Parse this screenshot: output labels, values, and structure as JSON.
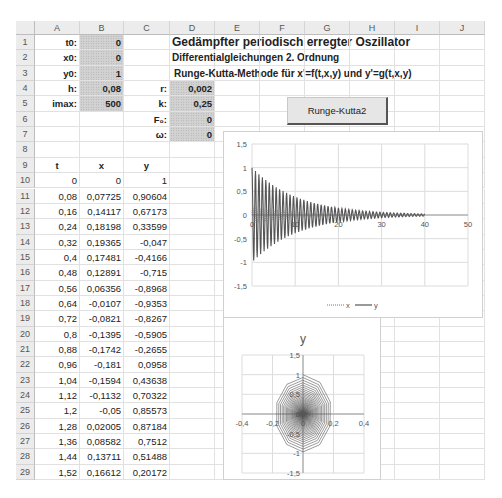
{
  "columns": [
    "A",
    "B",
    "C",
    "D",
    "E",
    "F",
    "G",
    "H",
    "I",
    "J"
  ],
  "rows": [
    1,
    2,
    3,
    4,
    5,
    6,
    7,
    8,
    9,
    10,
    11,
    12,
    13,
    14,
    15,
    16,
    17,
    18,
    19,
    20,
    21,
    22,
    23,
    24,
    25,
    26,
    27,
    28,
    29
  ],
  "params": {
    "t0": {
      "label": "t0:",
      "value": "0"
    },
    "x0": {
      "label": "x0:",
      "value": "0"
    },
    "y0": {
      "label": "y0:",
      "value": "1"
    },
    "h": {
      "label": "h:",
      "value": "0,08"
    },
    "imax": {
      "label": "imax:",
      "value": "500"
    },
    "r": {
      "label": "r:",
      "value": "0,002"
    },
    "k": {
      "label": "k:",
      "value": "0,25"
    },
    "F0": {
      "label": "F₀:",
      "value": "0"
    },
    "omega": {
      "label": "ω:",
      "value": "0"
    }
  },
  "titles": {
    "main": "Gedämpfter periodisch erregter Oszillator",
    "sub1": "Differentialgleichungen 2. Ordnung",
    "sub2": "Runge-Kutta-Methode für x'=f(t,x,y) und y'=g(t,x,y)"
  },
  "button": {
    "label": "Runge-Kutta2"
  },
  "table": {
    "headers": [
      "t",
      "x",
      "y"
    ],
    "rows": [
      [
        "0",
        "0",
        "1"
      ],
      [
        "0,08",
        "0,07725",
        "0,90604"
      ],
      [
        "0,16",
        "0,14117",
        "0,67173"
      ],
      [
        "0,24",
        "0,18198",
        "0,33599"
      ],
      [
        "0,32",
        "0,19365",
        "-0,047"
      ],
      [
        "0,4",
        "0,17481",
        "-0,4166"
      ],
      [
        "0,48",
        "0,12891",
        "-0,715"
      ],
      [
        "0,56",
        "0,06356",
        "-0,8968"
      ],
      [
        "0,64",
        "-0,0107",
        "-0,9353"
      ],
      [
        "0,72",
        "-0,0821",
        "-0,8267"
      ],
      [
        "0,8",
        "-0,1395",
        "-0,5905"
      ],
      [
        "0,88",
        "-0,1742",
        "-0,2655"
      ],
      [
        "0,96",
        "-0,181",
        "0,0958"
      ],
      [
        "1,04",
        "-0,1594",
        "0,43638"
      ],
      [
        "1,12",
        "-0,1132",
        "0,70322"
      ],
      [
        "1,2",
        "-0,05",
        "0,85573"
      ],
      [
        "1,28",
        "0,02005",
        "0,87184"
      ],
      [
        "1,36",
        "0,08582",
        "0,7512"
      ],
      [
        "1,44",
        "0,13711",
        "0,51488"
      ],
      [
        "1,52",
        "0,16612",
        "0,20172"
      ]
    ]
  },
  "chart_data": [
    {
      "type": "line",
      "title": "",
      "xlabel": "",
      "ylabel": "",
      "xlim": [
        0,
        50
      ],
      "ylim": [
        -1.5,
        1.5
      ],
      "x_ticks": [
        "0",
        "10",
        "20",
        "30",
        "40",
        "50"
      ],
      "y_ticks": [
        "1,5",
        "1",
        "0,5",
        "0",
        "-0,5",
        "-1",
        "-1,5"
      ],
      "grid": true,
      "legend": [
        "x",
        "y"
      ],
      "legend_position": "bottom",
      "series": [
        {
          "name": "x",
          "style": "dotted",
          "description": "damped oscillation amplitude ~0.19 decaying to ~0 by t=40"
        },
        {
          "name": "y",
          "style": "solid",
          "description": "damped oscillation amplitude ~1 decaying to ~0.02 by t=40, period ~0.8"
        }
      ],
      "x_range_data": [
        0,
        40
      ]
    },
    {
      "type": "scatter",
      "title": "y",
      "xlabel": "",
      "ylabel": "",
      "xlim": [
        -0.4,
        0.4
      ],
      "ylim": [
        -1.5,
        1.5
      ],
      "x_ticks": [
        "-0,4",
        "-0,2",
        "0",
        "0,2",
        "0,4"
      ],
      "y_ticks": [
        "1,5",
        "1",
        "0,5",
        "0",
        "-0,5",
        "-1",
        "-1,5"
      ],
      "grid": true,
      "description": "phase portrait x vs y: inward elliptical spiral from (0,1), x amplitude ~0.19, y amplitude ~1"
    }
  ]
}
